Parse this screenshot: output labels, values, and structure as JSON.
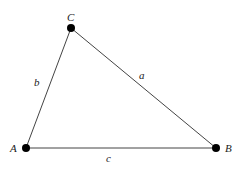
{
  "diagram": {
    "type": "triangle",
    "vertices": [
      {
        "id": "A",
        "label": "A",
        "x": 26,
        "y": 148
      },
      {
        "id": "B",
        "label": "B",
        "x": 216,
        "y": 148
      },
      {
        "id": "C",
        "label": "C",
        "x": 71,
        "y": 28
      }
    ],
    "sides": [
      {
        "id": "a",
        "label": "a",
        "from": "B",
        "to": "C"
      },
      {
        "id": "b",
        "label": "b",
        "from": "A",
        "to": "C"
      },
      {
        "id": "c",
        "label": "c",
        "from": "A",
        "to": "B"
      }
    ],
    "colors": {
      "line": "#444444",
      "point": "#000000",
      "text": "#222222"
    }
  }
}
